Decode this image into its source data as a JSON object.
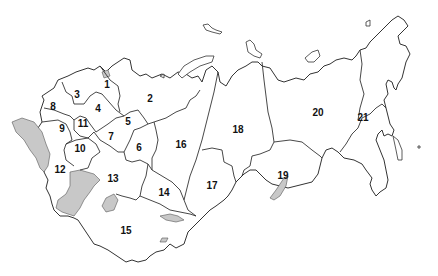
{
  "map": {
    "title": "",
    "colors": {
      "land": "#ffffff",
      "border": "#333333",
      "water": "#c8c8c8"
    },
    "regions": [
      {
        "id": "1",
        "label": "1",
        "x": 107,
        "y": 84
      },
      {
        "id": "2",
        "label": "2",
        "x": 150,
        "y": 98
      },
      {
        "id": "3",
        "label": "3",
        "x": 77,
        "y": 94
      },
      {
        "id": "4",
        "label": "4",
        "x": 98,
        "y": 108
      },
      {
        "id": "5",
        "label": "5",
        "x": 128,
        "y": 121
      },
      {
        "id": "6",
        "label": "6",
        "x": 139,
        "y": 147
      },
      {
        "id": "7",
        "label": "7",
        "x": 111,
        "y": 136
      },
      {
        "id": "8",
        "label": "8",
        "x": 53,
        "y": 106
      },
      {
        "id": "9",
        "label": "9",
        "x": 62,
        "y": 128
      },
      {
        "id": "10",
        "label": "10",
        "x": 80,
        "y": 148
      },
      {
        "id": "11",
        "label": "11",
        "x": 83,
        "y": 123
      },
      {
        "id": "12",
        "label": "12",
        "x": 60,
        "y": 169
      },
      {
        "id": "13",
        "label": "13",
        "x": 113,
        "y": 178
      },
      {
        "id": "14",
        "label": "14",
        "x": 164,
        "y": 192
      },
      {
        "id": "15",
        "label": "15",
        "x": 126,
        "y": 230
      },
      {
        "id": "16",
        "label": "16",
        "x": 181,
        "y": 144
      },
      {
        "id": "17",
        "label": "17",
        "x": 212,
        "y": 185
      },
      {
        "id": "18",
        "label": "18",
        "x": 238,
        "y": 129
      },
      {
        "id": "19",
        "label": "19",
        "x": 283,
        "y": 175
      },
      {
        "id": "20",
        "label": "20",
        "x": 318,
        "y": 112
      },
      {
        "id": "21",
        "label": "21",
        "x": 363,
        "y": 117
      }
    ]
  }
}
